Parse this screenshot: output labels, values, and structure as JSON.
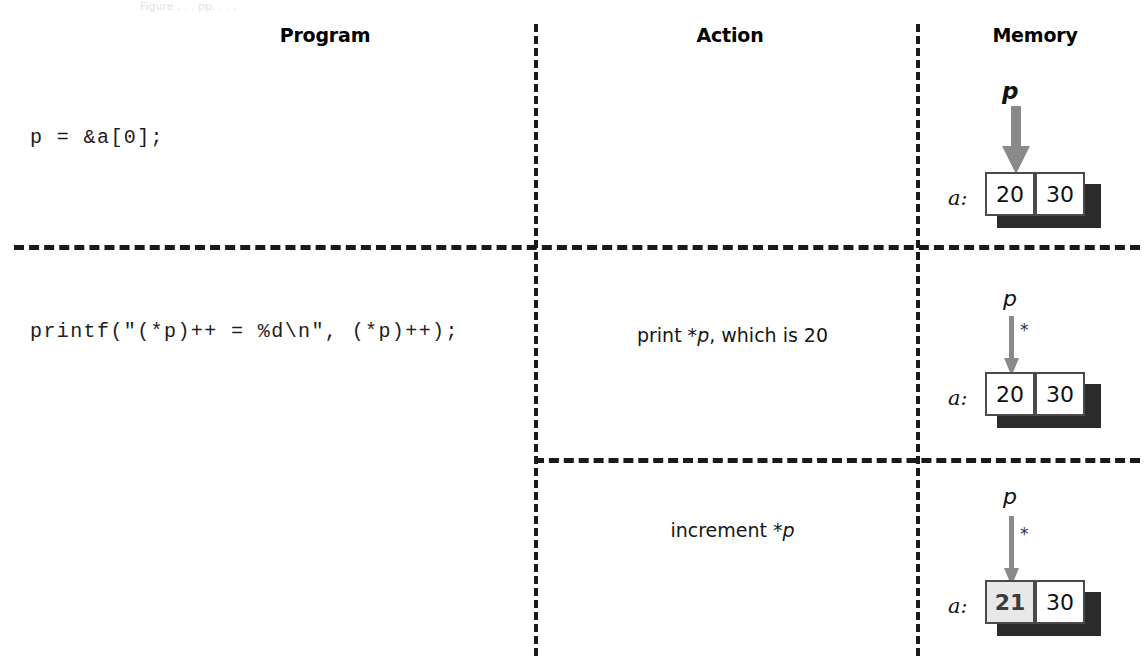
{
  "figure": {
    "artifact_text": "Figure  . . .  pp. . . .",
    "columns": [
      {
        "id": "program",
        "label": "Program"
      },
      {
        "id": "action",
        "label": "Action"
      },
      {
        "id": "memory",
        "label": "Memory"
      }
    ],
    "rows": [
      {
        "id": "row-1",
        "program": "p = &a[0];",
        "actions": [],
        "memory": {
          "array_label": "a:",
          "cells": [
            {
              "value": "20",
              "highlighted": false
            },
            {
              "value": "30",
              "highlighted": false
            }
          ],
          "pointer_label": "p",
          "pointer_bold": true,
          "deref_marker": "",
          "arrow_style": "thick"
        }
      },
      {
        "id": "row-2",
        "program": "printf(\"(*p)++ = %d\\n\", (*p)++);",
        "actions": [
          {
            "id": "action-print",
            "prefix": "print *",
            "italic": "p",
            "suffix": ", which is 20",
            "memory": {
              "array_label": "a:",
              "cells": [
                {
                  "value": "20",
                  "highlighted": false
                },
                {
                  "value": "30",
                  "highlighted": false
                }
              ],
              "pointer_label": "p",
              "pointer_bold": false,
              "deref_marker": "*",
              "arrow_style": "thin"
            }
          },
          {
            "id": "action-increment",
            "prefix": "increment *",
            "italic": "p",
            "suffix": "",
            "memory": {
              "array_label": "a:",
              "cells": [
                {
                  "value": "21",
                  "highlighted": true
                },
                {
                  "value": "30",
                  "highlighted": false
                }
              ],
              "pointer_label": "p",
              "pointer_bold": false,
              "deref_marker": "*",
              "arrow_style": "thin"
            }
          }
        ]
      }
    ],
    "colors": {
      "ink": "#1a1a1a",
      "arrow_gray": "#8a8a8a",
      "box_border": "#4a4a4a",
      "shadow": "#2b2b2b",
      "highlight_fill": "#e8e8e8",
      "highlight_text": "#3c3c3c",
      "paper": "#ffffff"
    }
  }
}
